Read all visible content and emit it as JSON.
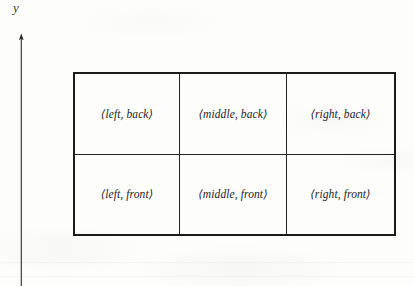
{
  "figure": {
    "axis": {
      "label": "y",
      "icon": "up-arrow-axis"
    },
    "table": {
      "rows": [
        {
          "name": "back-row",
          "cells": [
            {
              "name": "cell-left-back",
              "text": "⟨left, back⟩"
            },
            {
              "name": "cell-middle-back",
              "text": "⟨middle, back⟩"
            },
            {
              "name": "cell-right-back",
              "text": "⟨right, back⟩"
            }
          ]
        },
        {
          "name": "front-row",
          "cells": [
            {
              "name": "cell-left-front",
              "text": "⟨left, front⟩"
            },
            {
              "name": "cell-middle-front",
              "text": "⟨middle, front⟩"
            },
            {
              "name": "cell-right-front",
              "text": "⟨right, front⟩"
            }
          ]
        }
      ]
    },
    "colors": {
      "paper": "#fdfdfc",
      "ink": "#1b1b1b",
      "rule": "#242424",
      "axis": "#2e2e2e"
    }
  }
}
